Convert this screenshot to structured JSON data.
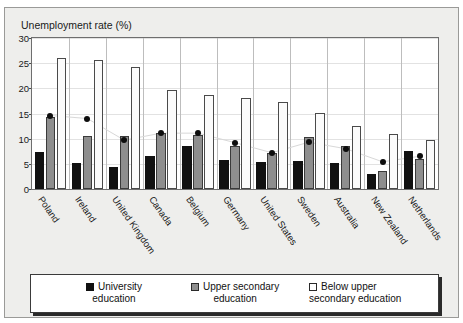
{
  "figure": {
    "top_fragment": "",
    "axis_title": "Unemployment rate (%)"
  },
  "chart_data": {
    "type": "bar",
    "title": "",
    "xlabel": "",
    "ylabel": "Unemployment rate (%)",
    "ylim": [
      0,
      30
    ],
    "yticks": [
      0,
      5,
      10,
      15,
      20,
      25,
      30
    ],
    "grid": true,
    "legend_position": "bottom",
    "categories": [
      "Poland",
      "Ireland",
      "United Kingdom",
      "Canada",
      "Belgium",
      "Germany",
      "United States",
      "Sweden",
      "Australia",
      "New Zealand",
      "Netherlands"
    ],
    "series": [
      {
        "name": "University education",
        "key": "university",
        "color": "#111111",
        "values": [
          7.4,
          5.2,
          4.3,
          6.5,
          8.6,
          5.7,
          5.4,
          5.6,
          5.1,
          2.9,
          7.5
        ]
      },
      {
        "name": "Upper secondary education",
        "key": "upper",
        "color": "#8e8e8e",
        "values": [
          14.3,
          10.5,
          10.6,
          11.2,
          10.8,
          8.6,
          7.1,
          10.3,
          8.5,
          3.6,
          6.0
        ]
      },
      {
        "name": "Below upper secondary education",
        "key": "below",
        "color": "#fbfbfb",
        "values": [
          26.1,
          25.6,
          24.3,
          19.6,
          18.6,
          18.1,
          17.3,
          15.1,
          12.5,
          10.9,
          9.8
        ]
      }
    ],
    "marker_series": {
      "name": "Overall rate",
      "color": "#0d0d0d",
      "values": [
        14.6,
        14.0,
        9.7,
        11.1,
        11.1,
        9.2,
        7.2,
        9.3,
        8.0,
        5.4,
        6.5
      ]
    },
    "legend": [
      {
        "label_line1": "University",
        "label_line2": "education",
        "key": "university"
      },
      {
        "label_line1": "Upper secondary",
        "label_line2": "education",
        "key": "upper"
      },
      {
        "label_line1": "Below upper",
        "label_line2": "secondary education",
        "key": "below"
      }
    ]
  }
}
